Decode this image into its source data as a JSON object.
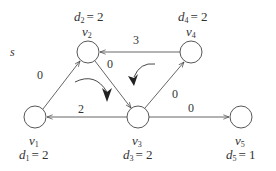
{
  "diagram": {
    "source_label": "s",
    "nodes": [
      {
        "id": "v1",
        "name": "v",
        "sub": "1",
        "d_name": "d",
        "d_sub": "1",
        "d_value": "= 2",
        "cx": 35,
        "cy": 117
      },
      {
        "id": "v2",
        "name": "v",
        "sub": "2",
        "d_name": "d",
        "d_sub": "2",
        "d_value": "= 2",
        "cx": 88,
        "cy": 52
      },
      {
        "id": "v3",
        "name": "v",
        "sub": "3",
        "d_name": "d",
        "d_sub": "3",
        "d_value": "= 2",
        "cx": 138,
        "cy": 117
      },
      {
        "id": "v4",
        "name": "v",
        "sub": "4",
        "d_name": "d",
        "d_sub": "4",
        "d_value": "= 2",
        "cx": 191,
        "cy": 52
      },
      {
        "id": "v5",
        "name": "v",
        "sub": "5",
        "d_name": "d",
        "d_sub": "5",
        "d_value": "= 1",
        "cx": 241,
        "cy": 117
      }
    ],
    "edges": [
      {
        "from": "v1",
        "to": "v2",
        "weight": "0"
      },
      {
        "from": "v2",
        "to": "v3",
        "weight": "0"
      },
      {
        "from": "v4",
        "to": "v2",
        "weight": "3"
      },
      {
        "from": "v3",
        "to": "v4",
        "weight": "0"
      },
      {
        "from": "v3",
        "to": "v1",
        "weight": "2"
      },
      {
        "from": "v3",
        "to": "v5",
        "weight": "0"
      }
    ],
    "cycle_arrows": [
      {
        "direction": "clockwise",
        "triangle": "v1-v2-v3"
      },
      {
        "direction": "counter-clockwise",
        "triangle": "v2-v3-v4"
      }
    ],
    "colors": {
      "stroke": "#444444",
      "text": "#333333",
      "background": "#ffffff"
    }
  }
}
